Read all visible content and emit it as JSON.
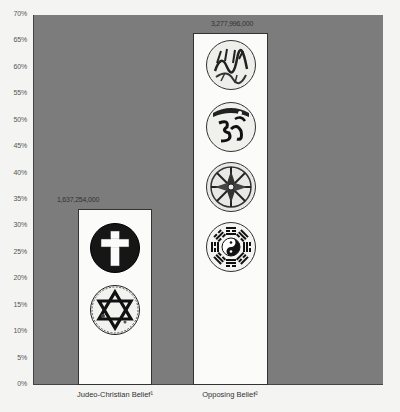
{
  "chart_data": {
    "type": "bar",
    "title": "",
    "xlabel": "",
    "ylabel": "",
    "ylim": [
      0,
      70
    ],
    "y_ticks": [
      "0%",
      "5%",
      "10%",
      "15%",
      "20%",
      "25%",
      "30%",
      "35%",
      "40%",
      "45%",
      "50%",
      "55%",
      "60%",
      "65%",
      "70%"
    ],
    "categories": [
      "Judeo-Christian Belief¹",
      "Opposing Belief²"
    ],
    "values": [
      33.3,
      66.7
    ],
    "data_labels": [
      "1,637,254,000",
      "3,277,996,000"
    ],
    "grid": false,
    "legend": null,
    "annotations": [
      {
        "bar": 0,
        "symbols": [
          "christian-cross",
          "star-of-david"
        ]
      },
      {
        "bar": 1,
        "symbols": [
          "islamic-calligraphy",
          "hindu-om",
          "buddhist-dharma-wheel",
          "yin-yang-bagua"
        ]
      }
    ],
    "colors": {
      "plot_background": "#7c7c7c",
      "bar_fill": "#fbfbf9",
      "page_background": "#f4f4f2"
    }
  },
  "axis": {
    "y_labels": [
      "70%",
      "65%",
      "60%",
      "55%",
      "50%",
      "45%",
      "40%",
      "35%",
      "30%",
      "25%",
      "20%",
      "15%",
      "10%",
      "5%",
      "0%"
    ]
  },
  "bars": [
    {
      "label": "Judeo-Christian Belief¹",
      "value_text": "1,637,254,000"
    },
    {
      "label": "Opposing Belief²",
      "value_text": "3,277,996,000"
    }
  ]
}
